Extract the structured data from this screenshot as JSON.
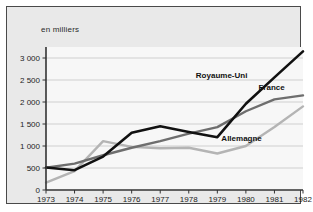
{
  "chart_data": {
    "type": "line",
    "title": "",
    "subtitle": "",
    "unit_note": "en milliers",
    "xlabel": "",
    "ylabel": "",
    "x": [
      1973,
      1974,
      1975,
      1976,
      1977,
      1978,
      1979,
      1980,
      1981,
      1982
    ],
    "xticklabels": [
      "1973",
      "1974",
      "1975",
      "1976",
      "1977",
      "1978",
      "1979",
      "1980",
      "1981",
      "1982"
    ],
    "yticks": [
      0,
      500,
      1000,
      1500,
      2000,
      2500,
      3000
    ],
    "yticklabels": [
      "0",
      "500",
      "1 000",
      "1 500",
      "2 000",
      "2 500",
      "3 000"
    ],
    "ylim": [
      0,
      3250
    ],
    "xlim": [
      1973,
      1982
    ],
    "grid": "horizontal",
    "legend_position": "inline-right",
    "series": [
      {
        "name": "Royaume-Uni",
        "color": "#111111",
        "width": 2.6,
        "values": [
          510,
          450,
          760,
          1300,
          1450,
          1320,
          1200,
          1960,
          2560,
          3150
        ],
        "label_x": 1979.15,
        "label_y": 2620
      },
      {
        "name": "France",
        "color": "#6e6e6e",
        "width": 2.4,
        "values": [
          505,
          600,
          790,
          960,
          1110,
          1280,
          1430,
          1790,
          2060,
          2150
        ],
        "label_x": 1980.9,
        "label_y": 2330
      },
      {
        "name": "Allemagne",
        "color": "#b4b4b4",
        "width": 2.4,
        "values": [
          170,
          430,
          1110,
          980,
          950,
          960,
          830,
          1000,
          1430,
          1900
        ],
        "label_x": 1979.85,
        "label_y": 1180
      }
    ],
    "colors": {
      "frame_background": "#e9e9e9",
      "frame_border": "#4a4a4a",
      "plot_background": "#f7f7f7",
      "grid": "#cfcfcf",
      "axis": "#333333",
      "text": "#1d1d1d"
    }
  }
}
